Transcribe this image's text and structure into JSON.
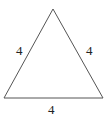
{
  "diagram": {
    "shape": "equilateral triangle",
    "stroke_color": "#555555",
    "vertices": {
      "top": [
        53,
        9
      ],
      "bottom_left": [
        4,
        98
      ],
      "bottom_right": [
        103,
        98
      ]
    },
    "side_labels": {
      "left": "4",
      "right": "4",
      "bottom": "4"
    }
  }
}
